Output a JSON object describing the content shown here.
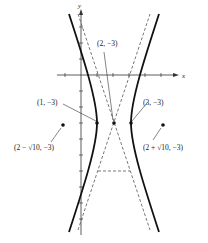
{
  "diagram": {
    "type": "hyperbola-graph",
    "equation": "(x-2)^2 - (y+3)^2/9 = 1",
    "axes": {
      "x_label": "x",
      "y_label": "y"
    },
    "center": {
      "label": "(2, −3)",
      "x": 2,
      "y": -3
    },
    "vertices": [
      {
        "label": "(1, −3)",
        "x": 1,
        "y": -3
      },
      {
        "label": "(3, −3)",
        "x": 3,
        "y": -3
      }
    ],
    "foci": [
      {
        "label": "(2 − √10, −3)",
        "x": -1.162,
        "y": -3
      },
      {
        "label": "(2 + √10, −3)",
        "x": 5.162,
        "y": -3
      }
    ],
    "asymptotes": [
      "y + 3 = 3(x − 2)",
      "y + 3 = −3(x − 2)"
    ],
    "colors": {
      "curve": "#111111",
      "dashed": "#555555",
      "axis": "#333333"
    }
  }
}
